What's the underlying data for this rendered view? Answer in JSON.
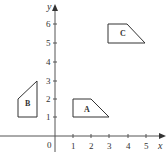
{
  "figure": {
    "title": "",
    "x_axis_label": "x",
    "y_axis_label": "y",
    "origin_label": "0",
    "x_ticks": [
      "1",
      "2",
      "3",
      "4",
      "5"
    ],
    "y_ticks": [
      "1",
      "2",
      "3",
      "4",
      "5",
      "6"
    ]
  },
  "shapes": [
    {
      "label": "A",
      "vertices": [
        [
          1,
          1
        ],
        [
          1,
          2
        ],
        [
          2,
          2
        ],
        [
          3,
          1
        ]
      ]
    },
    {
      "label": "B",
      "vertices": [
        [
          -2,
          1
        ],
        [
          -2,
          2
        ],
        [
          -1,
          3
        ],
        [
          -1,
          1
        ]
      ]
    },
    {
      "label": "C",
      "vertices": [
        [
          3,
          5
        ],
        [
          3,
          6
        ],
        [
          4,
          6
        ],
        [
          5,
          5
        ]
      ]
    }
  ],
  "colors": {
    "axis": "#555555",
    "shape_stroke": "#333333",
    "text": "#333333"
  }
}
